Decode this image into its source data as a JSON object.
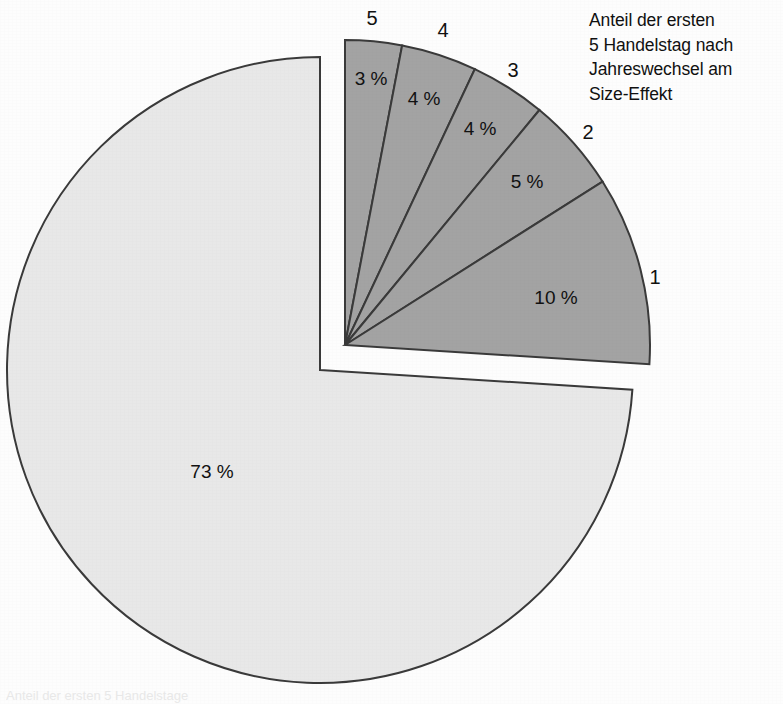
{
  "title": {
    "line1": "Anteil der ersten",
    "line2": "5 Handelstag nach",
    "line3": "Jahreswechsel am",
    "line4": "Size-Effekt"
  },
  "footer": {
    "caption": "Anteil der ersten 5 Handelstage"
  },
  "colors": {
    "highlight_fill": "#a3a3a3",
    "remainder_fill": "#e8e8e8",
    "outline": "#3a3a3a",
    "background": "#fdfdfd",
    "text": "#111111"
  },
  "chart_data": {
    "type": "pie",
    "title": "Anteil der ersten 5 Handelstag nach Jahreswechsel am Size-Effekt",
    "unit": "%",
    "total": 100,
    "legend_position": "none",
    "grid": false,
    "exploded_group_label": "Handelstage 1-5",
    "slices": [
      {
        "name": "1",
        "leader": "1",
        "value": 10,
        "label": "10 %",
        "fill": "#a3a3a3",
        "exploded": true,
        "label_x": 556,
        "label_y": 304,
        "leader_x": 655,
        "leader_y": 284
      },
      {
        "name": "2",
        "leader": "2",
        "value": 5,
        "label": "5 %",
        "fill": "#a3a3a3",
        "exploded": true,
        "label_x": 527,
        "label_y": 188,
        "leader_x": 588,
        "leader_y": 139
      },
      {
        "name": "3",
        "leader": "3",
        "value": 4,
        "label": "4 %",
        "fill": "#a3a3a3",
        "exploded": true,
        "label_x": 480,
        "label_y": 135,
        "leader_x": 513,
        "leader_y": 77
      },
      {
        "name": "4",
        "leader": "4",
        "value": 4,
        "label": "4 %",
        "fill": "#a3a3a3",
        "exploded": true,
        "label_x": 424,
        "label_y": 105,
        "leader_x": 443,
        "leader_y": 37
      },
      {
        "name": "5",
        "leader": "5",
        "value": 3,
        "label": "3 %",
        "fill": "#a3a3a3",
        "exploded": true,
        "label_x": 371,
        "label_y": 85,
        "leader_x": 372,
        "leader_y": 25
      },
      {
        "name": "Rest",
        "leader": "",
        "value": 73,
        "label": "73 %",
        "fill": "#e8e8e8",
        "exploded": false,
        "label_x": 212,
        "label_y": 478,
        "leader_x": null,
        "leader_y": null
      }
    ]
  },
  "geometry": {
    "main_center_x": 320,
    "main_center_y": 370,
    "main_radius": 313,
    "explode_center_x": 345,
    "explode_center_y": 345,
    "explode_radius": 305
  }
}
